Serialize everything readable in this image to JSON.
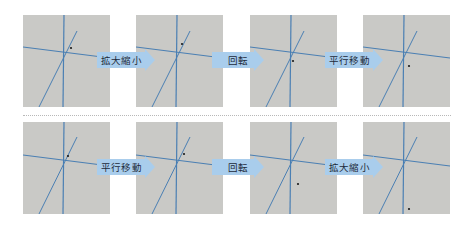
{
  "colors": {
    "panel_bg": "#c9c9c6",
    "line": "#4a7fb3",
    "arrow_fill": "#a9cdec",
    "point": "#1a1a1a",
    "divider": "#b8b8b8"
  },
  "rows": [
    {
      "name": "top-row",
      "steps": [
        "拡大縮小",
        "回転",
        "平行移動"
      ],
      "panels": [
        {
          "point": [
            48,
            33
          ]
        },
        {
          "point": [
            46,
            29
          ]
        },
        {
          "point": [
            43,
            46
          ]
        },
        {
          "point": [
            46,
            51
          ]
        }
      ]
    },
    {
      "name": "bottom-row",
      "steps": [
        "平行移動",
        "回転",
        "拡大縮小"
      ],
      "panels": [
        {
          "point": [
            45,
            34
          ]
        },
        {
          "point": [
            48,
            32
          ]
        },
        {
          "point": [
            48,
            62
          ]
        },
        {
          "point": [
            46,
            87
          ]
        }
      ]
    }
  ]
}
